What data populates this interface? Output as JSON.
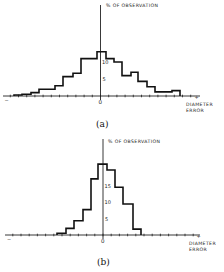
{
  "chart_data": [
    {
      "type": "bar",
      "subtype": "histogram-step",
      "caption": "(a)",
      "ylabel": "% OF OBSERVATION",
      "xlabel_line1": "DIAMETER",
      "xlabel_line2": "ERROR",
      "x_zero_label": "0",
      "x_neg_label": "−",
      "x_pos_label": "+",
      "y_ticks": [
        5,
        10
      ],
      "ylim": [
        0,
        26
      ],
      "bins_x_px": [
        14,
        22,
        31,
        39,
        55,
        63,
        73,
        81,
        97,
        106,
        114,
        122,
        131,
        138,
        147,
        155,
        172,
        180
      ],
      "values": [
        0.3,
        0.5,
        1,
        2,
        3,
        5.7,
        6.7,
        11,
        13,
        11,
        10,
        6,
        7,
        4.3,
        2.7,
        1.2,
        1.6
      ],
      "grid": false
    },
    {
      "type": "bar",
      "subtype": "histogram-step",
      "caption": "(b)",
      "ylabel": "% OF OBSERVATION",
      "xlabel_line1": "DIAMETER",
      "xlabel_line2": "ERROR",
      "x_zero_label": "0",
      "x_neg_label": "−",
      "x_pos_label": "+",
      "y_ticks": [
        5,
        10,
        15
      ],
      "ylim": [
        0,
        28
      ],
      "bins_x_px": [
        57,
        66,
        74,
        83,
        91,
        98,
        107,
        115,
        123,
        133,
        141
      ],
      "values": [
        0.5,
        2,
        4.3,
        7.7,
        17,
        21.5,
        19.7,
        14.5,
        9.4,
        1.8
      ],
      "grid": false
    }
  ],
  "panels": [
    {
      "caption": "(a)"
    },
    {
      "caption": "(b)"
    }
  ]
}
